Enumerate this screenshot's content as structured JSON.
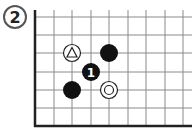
{
  "diagram": {
    "type": "go-board",
    "label": "2",
    "grid": {
      "x_lines": [
        35,
        54,
        72,
        91,
        109,
        128,
        146,
        165,
        183
      ],
      "y_lines": [
        17,
        35,
        53,
        72,
        90,
        108
      ],
      "left_edge_x": 35,
      "bottom_edge_y": 126,
      "right_limit_x": 192,
      "top_limit_y": 10
    },
    "stones": [
      {
        "id": "white-triangle",
        "color": "white",
        "x": 72,
        "y": 53,
        "mark": "triangle"
      },
      {
        "id": "black-a",
        "color": "black",
        "x": 109,
        "y": 53,
        "mark": ""
      },
      {
        "id": "black-1",
        "color": "black",
        "x": 91,
        "y": 72,
        "mark": "1"
      },
      {
        "id": "black-b",
        "color": "black",
        "x": 72,
        "y": 90,
        "mark": ""
      },
      {
        "id": "white-circle",
        "color": "white",
        "x": 109,
        "y": 90,
        "mark": "circle"
      }
    ],
    "move_number": "1",
    "colors": {
      "line": "#8a8a8a",
      "edge": "#222222",
      "black": "#111111",
      "white": "#ffffff"
    }
  }
}
